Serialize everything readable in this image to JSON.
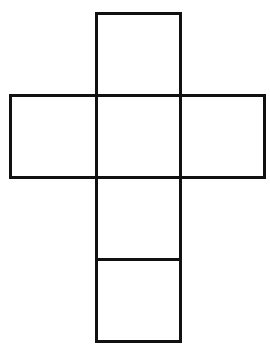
{
  "figure": {
    "title": "",
    "stroke_color": "#111111",
    "background": "#ffffff",
    "squares": [
      {
        "id": "top",
        "x": 95,
        "y": 12,
        "w": 87,
        "h": 85
      },
      {
        "id": "middle-left",
        "x": 9,
        "y": 94,
        "w": 89,
        "h": 85
      },
      {
        "id": "middle-center",
        "x": 95,
        "y": 94,
        "w": 87,
        "h": 85
      },
      {
        "id": "middle-right",
        "x": 179,
        "y": 94,
        "w": 87,
        "h": 85
      },
      {
        "id": "lower",
        "x": 95,
        "y": 176,
        "w": 87,
        "h": 85
      },
      {
        "id": "bottom",
        "x": 95,
        "y": 258,
        "w": 87,
        "h": 85
      }
    ]
  }
}
